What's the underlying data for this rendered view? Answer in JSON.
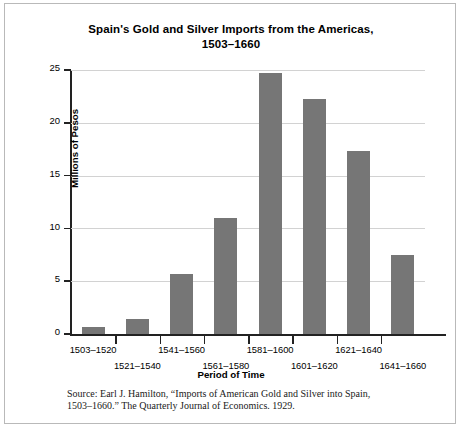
{
  "chart_data": {
    "type": "bar",
    "title": "Spain's Gold and Silver Imports from the Americas, 1503–1660",
    "title_line1": "Spain's Gold and Silver Imports from the Americas,",
    "title_line2": "1503–1660",
    "xlabel": "Period of Time",
    "ylabel": "Millions of Pesos",
    "categories": [
      "1503–1520",
      "1521–1540",
      "1541–1560",
      "1561–1580",
      "1581–1600",
      "1601–1620",
      "1621–1640",
      "1641–1660"
    ],
    "values": [
      0.7,
      1.4,
      5.7,
      11.0,
      24.7,
      22.3,
      17.3,
      7.5
    ],
    "ylim": [
      0,
      25
    ],
    "yticks": [
      0,
      5,
      10,
      15,
      20,
      25
    ],
    "ytick_labels": [
      "0",
      "5",
      "10",
      "15",
      "20",
      "25"
    ],
    "grid": true,
    "legend": false,
    "bar_color": "#767676",
    "grid_color": "#d2d2d2",
    "axis_color": "#222222"
  },
  "source": {
    "line1": "Source: Earl J. Hamilton, “Imports of American Gold and Silver into Spain,",
    "line2": "1503–1660.” The Quarterly Journal of Economics. 1929."
  }
}
